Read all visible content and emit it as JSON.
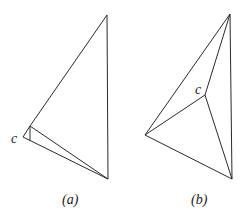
{
  "figure_a": {
    "caption": "(a)",
    "point_label": "c",
    "vertices": {
      "top": [
        107,
        15
      ],
      "bottom": [
        108,
        179
      ],
      "c": [
        23,
        137
      ],
      "upper": [
        30,
        126
      ],
      "lower": [
        30,
        141
      ]
    }
  },
  "figure_b": {
    "caption": "(b)",
    "point_label": "c",
    "vertices": {
      "top": [
        230,
        14
      ],
      "left": [
        145,
        135
      ],
      "bottom": [
        232,
        179
      ],
      "c": [
        205,
        95
      ]
    }
  },
  "colors": {
    "stroke": "#2a2a2a",
    "background": "#ffffff"
  }
}
